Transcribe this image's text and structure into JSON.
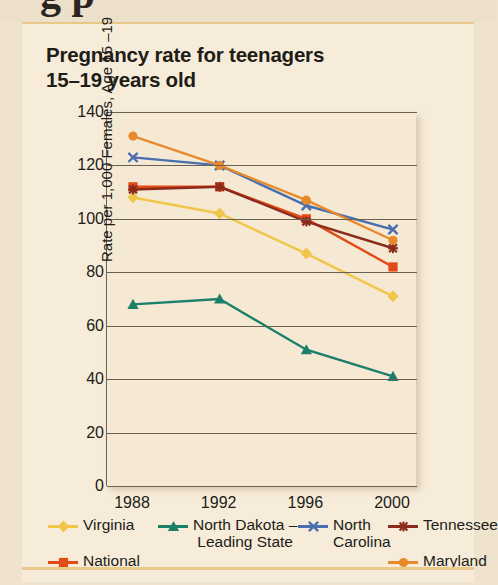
{
  "page": {
    "top_strip_ghost_text": "g p",
    "background_color": "#efe3ce",
    "card_color": "#f7ecd9",
    "plot_color": "#f6e9d4",
    "rule_color": "#e9c88a"
  },
  "title": {
    "line1": "Pregnancy rate for teenagers",
    "line2": "15–19 years old"
  },
  "chart_data": {
    "type": "line",
    "title": "Pregnancy rate for teenagers 15–19 years old",
    "xlabel": "",
    "ylabel": "Rate per 1,000 Females, Age 15 –19",
    "x": [
      "1988",
      "1992",
      "1996",
      "2000"
    ],
    "categories": [
      "1988",
      "1992",
      "1996",
      "2000"
    ],
    "ylim": [
      0,
      140
    ],
    "ytick_labels": [
      "0",
      "20",
      "40",
      "60",
      "80",
      "100",
      "120",
      "140"
    ],
    "ytick_values": [
      0,
      20,
      40,
      60,
      80,
      100,
      120,
      140
    ],
    "grid": true,
    "legend_position": "bottom",
    "series": [
      {
        "name": "Virginia",
        "label_line1": "Virginia",
        "label_line2": "",
        "color": "#f0c64a",
        "marker": "diamond",
        "values": [
          108,
          102,
          87,
          71
        ]
      },
      {
        "name": "National",
        "label_line1": "National",
        "label_line2": "",
        "color": "#e24a16",
        "marker": "square",
        "values": [
          112,
          112,
          100,
          82
        ]
      },
      {
        "name": "North Dakota – Leading State",
        "label_line1": "North Dakota –",
        "label_line2": "Leading State",
        "color": "#1b7f6a",
        "marker": "triangle",
        "values": [
          68,
          70,
          51,
          41
        ]
      },
      {
        "name": "North Carolina",
        "label_line1": "North",
        "label_line2": "Carolina",
        "color": "#4a6fae",
        "marker": "cross",
        "values": [
          123,
          120,
          105,
          96
        ]
      },
      {
        "name": "Tennessee",
        "label_line1": "Tennessee",
        "label_line2": "",
        "color": "#8c2b1c",
        "marker": "star",
        "values": [
          111,
          112,
          99,
          89
        ]
      },
      {
        "name": "Maryland",
        "label_line1": "Maryland",
        "label_line2": "",
        "color": "#e8892b",
        "marker": "circle",
        "values": [
          131,
          120,
          107,
          92
        ]
      }
    ]
  }
}
